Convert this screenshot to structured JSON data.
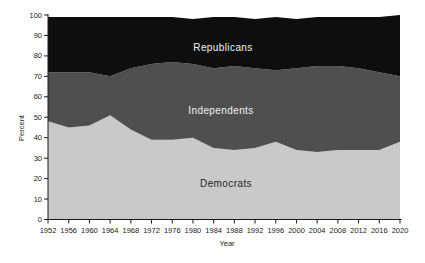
{
  "chart_data": {
    "type": "area",
    "stacked": true,
    "title": "",
    "xlabel": "Year",
    "ylabel": "Percent",
    "x": [
      1952,
      1956,
      1960,
      1964,
      1968,
      1972,
      1976,
      1980,
      1984,
      1988,
      1992,
      1996,
      2000,
      2004,
      2008,
      2012,
      2016,
      2020
    ],
    "series": [
      {
        "name": "Democrats",
        "color": "#c9c9c9",
        "label_color": "#262626",
        "values": [
          48,
          45,
          46,
          51,
          44,
          39,
          39,
          40,
          35,
          34,
          35,
          38,
          34,
          33,
          34,
          34,
          34,
          38
        ]
      },
      {
        "name": "Independents",
        "color": "#4f4f4f",
        "label_color": "#f2f2f2",
        "values": [
          24,
          27,
          26,
          19,
          30,
          37,
          38,
          36,
          39,
          41,
          39,
          35,
          40,
          42,
          41,
          40,
          38,
          32
        ]
      },
      {
        "name": "Republicans",
        "color": "#0e0e0e",
        "label_color": "#f2f2f2",
        "values": [
          27,
          27,
          27,
          29,
          25,
          23,
          22,
          22,
          25,
          24,
          24,
          26,
          24,
          24,
          24,
          25,
          27,
          30
        ]
      }
    ],
    "ylim": [
      0,
      100
    ],
    "y_ticks": [
      0,
      10,
      20,
      30,
      40,
      50,
      60,
      70,
      80,
      90,
      100
    ],
    "x_ticks": [
      1952,
      1956,
      1960,
      1964,
      1968,
      1972,
      1976,
      1980,
      1984,
      1988,
      1992,
      1996,
      2000,
      2004,
      2008,
      2012,
      2016,
      2020
    ],
    "grid": false,
    "legend": "in-plot area labels",
    "axis_color": "#1a1a1a",
    "background_color": "#ffffff"
  },
  "labels": {
    "republicans": "Republicans",
    "independents": "Independents",
    "democrats": "Democrats"
  }
}
